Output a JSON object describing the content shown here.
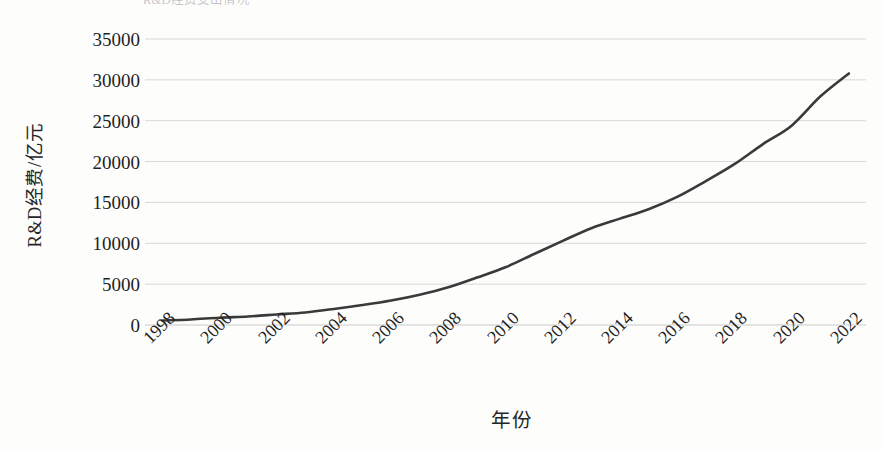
{
  "figure": {
    "caption_clipped": "R&D经费支出情况",
    "background_color": "#fdfdfc"
  },
  "chart_data": {
    "type": "line",
    "title": "",
    "subtitle": "",
    "xlabel": "年份",
    "ylabel": "R&D经费/亿元",
    "grid": true,
    "grid_axis": "y",
    "legend": false,
    "legend_position": "none",
    "line_color": "#3a3a3a",
    "line_width": 2.6,
    "smooth": true,
    "markers": false,
    "xlim": [
      1997.4,
      2022.6
    ],
    "ylim": [
      0,
      35000
    ],
    "ytick_labels": [
      "0",
      "5000",
      "10000",
      "15000",
      "20000",
      "25000",
      "30000",
      "35000"
    ],
    "yticks": [
      0,
      5000,
      10000,
      15000,
      20000,
      25000,
      30000,
      35000
    ],
    "xtick_labels": [
      "1998",
      "2000",
      "2002",
      "2004",
      "2006",
      "2008",
      "2010",
      "2012",
      "2014",
      "2016",
      "2018",
      "2020",
      "2022"
    ],
    "xticks": [
      1998,
      2000,
      2002,
      2004,
      2006,
      2008,
      2010,
      2012,
      2014,
      2016,
      2018,
      2020,
      2022
    ],
    "x": [
      1998,
      1999,
      2000,
      2001,
      2002,
      2003,
      2004,
      2005,
      2006,
      2007,
      2008,
      2009,
      2010,
      2011,
      2012,
      2013,
      2014,
      2015,
      2016,
      2017,
      2018,
      2019,
      2020,
      2021,
      2022
    ],
    "values": [
      551,
      679,
      896,
      1043,
      1288,
      1540,
      1966,
      2450,
      3003,
      3710,
      4616,
      5802,
      7063,
      8687,
      10298,
      11847,
      13016,
      14170,
      15677,
      17606,
      19678,
      22144,
      24393,
      27956,
      30783
    ],
    "series": [
      {
        "name": "R&D经费",
        "values": [
          551,
          679,
          896,
          1043,
          1288,
          1540,
          1966,
          2450,
          3003,
          3710,
          4616,
          5802,
          7063,
          8687,
          10298,
          11847,
          13016,
          14170,
          15677,
          17606,
          19678,
          22144,
          24393,
          27956,
          30783
        ]
      }
    ]
  }
}
